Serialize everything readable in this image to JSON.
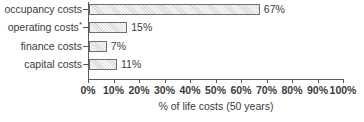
{
  "chart_data": {
    "type": "bar",
    "orientation": "horizontal",
    "title": "",
    "xlabel": "% of life costs (50 years)",
    "ylabel": "",
    "xlim": [
      0,
      100
    ],
    "grid": false,
    "legend": null,
    "categories": [
      "occupancy costs",
      "operating costs*",
      "finance costs",
      "capital costs"
    ],
    "values": [
      67,
      15,
      7,
      11
    ],
    "value_labels": [
      "67%",
      "15%",
      "7%",
      "11%"
    ],
    "xticks": [
      0,
      10,
      20,
      30,
      40,
      50,
      60,
      70,
      80,
      90,
      100
    ],
    "xtick_labels": [
      "0%",
      "10%",
      "20%",
      "30%",
      "40%",
      "50%",
      "60%",
      "70%",
      "80%",
      "90%",
      "100%"
    ],
    "bars": [
      {
        "category": "occupancy costs",
        "category_base": "occupancy costs",
        "footnote_marker": "",
        "value": 67,
        "label": "67%"
      },
      {
        "category": "operating costs*",
        "category_base": "operating costs",
        "footnote_marker": "*",
        "value": 15,
        "label": "15%"
      },
      {
        "category": "finance costs",
        "category_base": "finance costs",
        "footnote_marker": "",
        "value": 7,
        "label": "7%"
      },
      {
        "category": "capital costs",
        "category_base": "capital costs",
        "footnote_marker": "",
        "value": 11,
        "label": "11%"
      }
    ],
    "colors": {
      "bar_fill": "#d9d9d9",
      "bar_border": "#6e6e6e",
      "axis": "#5a5a5a",
      "text": "#3b3b3b",
      "background": "#ffffff"
    }
  }
}
